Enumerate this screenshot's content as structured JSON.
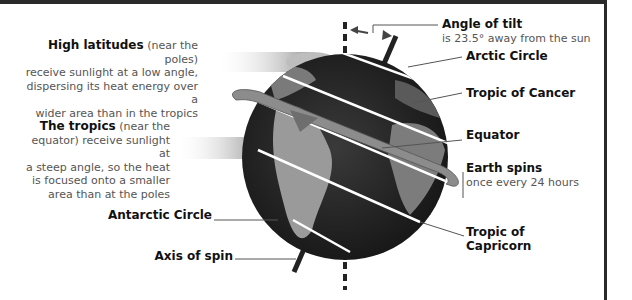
{
  "diagram": {
    "descriptions": {
      "high_latitudes": {
        "heading": "High latitudes",
        "text_1": " (near the poles)",
        "text_2": "receive sunlight at a low angle,",
        "text_3": "dispersing its heat energy over a",
        "text_4": "wider area than in the tropics"
      },
      "tropics": {
        "heading": "The tropics",
        "text_1": " (near the",
        "text_2": "equator) receive sunlight at",
        "text_3": "a steep angle, so the heat",
        "text_4": "is focused onto a smaller",
        "text_5": "area than at the poles"
      }
    },
    "labels": {
      "angle_of_tilt": "Angle of tilt",
      "angle_of_tilt_sub": "is 23.5° away from the sun",
      "arctic_circle": "Arctic Circle",
      "tropic_of_cancer": "Tropic of Cancer",
      "equator": "Equator",
      "earth_spins": "Earth spins",
      "earth_spins_sub": "once every 24 hours",
      "tropic_of_capricorn_1": "Tropic of",
      "tropic_of_capricorn_2": "Capricorn",
      "antarctic_circle": "Antarctic Circle",
      "axis_of_spin": "Axis of spin"
    },
    "colors": {
      "globe_ocean": "#2b2b2b",
      "globe_land": "#8a8a8a",
      "lines": "#ffffff",
      "leader": "#555555",
      "text": "#111111"
    }
  }
}
